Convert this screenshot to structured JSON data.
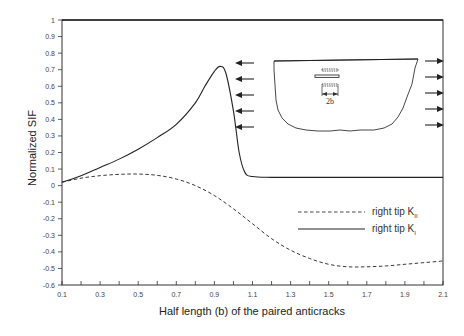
{
  "chart_data": {
    "type": "line",
    "title": "",
    "xlabel": "Half length (b) of the paired anticracks",
    "ylabel": "Normalized SIF",
    "xlim": [
      0.1,
      2.1
    ],
    "ylim": [
      -0.6,
      1.0
    ],
    "grid": false,
    "x_ticks": [
      "0.1",
      "0.3",
      "0.5",
      "0.7",
      "0.9",
      "1.1",
      "1.3",
      "1.5",
      "1.7",
      "1.9",
      "2.1"
    ],
    "x_tick_values": [
      0.1,
      0.3,
      0.5,
      0.7,
      0.9,
      1.1,
      1.3,
      1.5,
      1.7,
      1.9,
      2.1
    ],
    "y_ticks": [
      "1",
      "0.9",
      "0.8",
      "0.7",
      "0.6",
      "0.5",
      "0.4",
      "0.3",
      "0.2",
      "0.1",
      "0",
      "-0.1",
      "-0.2",
      "-0.3",
      "-0.4",
      "-0.5",
      "-0.6"
    ],
    "y_tick_values": [
      1,
      0.9,
      0.8,
      0.7,
      0.6,
      0.5,
      0.4,
      0.3,
      0.2,
      0.1,
      0,
      -0.1,
      -0.2,
      -0.3,
      -0.4,
      -0.5,
      -0.6
    ],
    "legend_position": "lower right (inside plot)",
    "series": [
      {
        "name": "right tip K_II",
        "label_main": "right tip K",
        "label_sub": "II",
        "style": "dashed",
        "x": [
          0.1,
          0.2,
          0.3,
          0.4,
          0.5,
          0.6,
          0.7,
          0.8,
          0.9,
          1.0,
          1.1,
          1.2,
          1.3,
          1.4,
          1.5,
          1.6,
          1.7,
          1.8,
          1.9,
          2.0,
          2.1
        ],
        "y": [
          0.02,
          0.045,
          0.06,
          0.068,
          0.07,
          0.062,
          0.04,
          0.0,
          -0.06,
          -0.14,
          -0.23,
          -0.32,
          -0.39,
          -0.44,
          -0.475,
          -0.49,
          -0.49,
          -0.485,
          -0.475,
          -0.465,
          -0.455
        ]
      },
      {
        "name": "right tip K_I",
        "label_main": "right tip K",
        "label_sub": "I",
        "style": "solid",
        "x": [
          0.1,
          0.2,
          0.3,
          0.4,
          0.5,
          0.6,
          0.7,
          0.8,
          0.85,
          0.9,
          0.93,
          0.96,
          1.0,
          1.03,
          1.06,
          1.1,
          1.2,
          1.4,
          1.6,
          1.8,
          2.0,
          2.1
        ],
        "y": [
          0.02,
          0.06,
          0.11,
          0.16,
          0.22,
          0.29,
          0.37,
          0.5,
          0.6,
          0.69,
          0.72,
          0.68,
          0.45,
          0.2,
          0.08,
          0.055,
          0.05,
          0.05,
          0.05,
          0.05,
          0.05,
          0.05
        ]
      }
    ],
    "annotations": [
      {
        "type": "inset-diagram",
        "description": "U-shaped domain with three horizontal paired anticracks and tensile arrows on both sides",
        "label": "2b"
      }
    ]
  },
  "inset": {
    "dimension_label": "2b",
    "left_arrow_count": 5,
    "right_arrow_count": 5
  }
}
